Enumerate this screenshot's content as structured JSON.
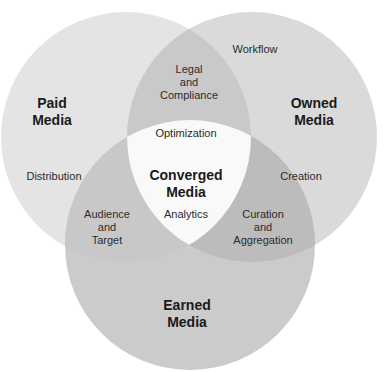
{
  "diagram": {
    "type": "venn-3",
    "colors": {
      "paid": "#e4e4e4",
      "owned": "#dadada",
      "earned": "#cbcbcb",
      "paid_owned": "#c9c9c9",
      "paid_earned": "#c8c8c8",
      "owned_earned": "#bcbcbc",
      "center": "#f9f9f9"
    },
    "circles": [
      {
        "id": "paid",
        "title_line1": "Paid",
        "title_line2": "Media"
      },
      {
        "id": "owned",
        "title_line1": "Owned",
        "title_line2": "Media"
      },
      {
        "id": "earned",
        "title_line1": "Earned",
        "title_line2": "Media"
      }
    ],
    "regions": {
      "paid_only": "Distribution",
      "owned_only_top": "Workflow",
      "owned_only_side": "Creation",
      "paid_owned": {
        "line1": "Legal",
        "line2": "and",
        "line3": "Compliance"
      },
      "paid_earned": {
        "line1": "Audience",
        "line2": "and",
        "line3": "Target"
      },
      "owned_earned": {
        "line1": "Curation",
        "line2": "and",
        "line3": "Aggregation"
      },
      "center": {
        "top": "Optimization",
        "title_line1": "Converged",
        "title_line2": "Media",
        "bottom": "Analytics"
      }
    }
  }
}
